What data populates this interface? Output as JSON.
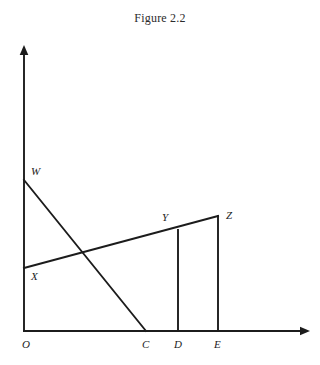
{
  "figure": {
    "caption": "Figure 2.2",
    "stroke_color": "#1c1c1c",
    "background_color": "#ffffff"
  },
  "axes": {
    "origin_label": "O",
    "origin": {
      "x": 24,
      "y": 331
    },
    "x_axis": {
      "from": {
        "x": 24,
        "y": 331
      },
      "to": {
        "x": 310,
        "y": 331
      },
      "arrow": true
    },
    "y_axis": {
      "from": {
        "x": 24,
        "y": 331
      },
      "to": {
        "x": 24,
        "y": 45
      },
      "arrow": true
    }
  },
  "points": [
    {
      "id": "W",
      "label": "W",
      "x": 24,
      "y": 180,
      "label_x": 31,
      "label_y": 166
    },
    {
      "id": "X",
      "label": "X",
      "x": 24,
      "y": 268,
      "label_x": 31,
      "label_y": 271
    },
    {
      "id": "Y",
      "label": "Y",
      "x": 178,
      "y": 230,
      "label_x": 162,
      "label_y": 212
    },
    {
      "id": "Z",
      "label": "Z",
      "x": 218,
      "y": 216,
      "label_x": 226,
      "label_y": 210
    },
    {
      "id": "C",
      "label": "C",
      "x": 146,
      "y": 331,
      "label_x": 142,
      "label_y": 339
    },
    {
      "id": "D",
      "label": "D",
      "x": 178,
      "y": 331,
      "label_x": 174,
      "label_y": 339
    },
    {
      "id": "E",
      "label": "E",
      "x": 218,
      "y": 331,
      "label_x": 214,
      "label_y": 339
    }
  ],
  "segments": [
    {
      "name": "line-w-to-c",
      "from": {
        "x": 24,
        "y": 180
      },
      "to": {
        "x": 146,
        "y": 331
      }
    },
    {
      "name": "line-x-to-z",
      "from": {
        "x": 24,
        "y": 268
      },
      "to": {
        "x": 218,
        "y": 216
      }
    },
    {
      "name": "vertical-y-to-d",
      "from": {
        "x": 178,
        "y": 230
      },
      "to": {
        "x": 178,
        "y": 331
      }
    },
    {
      "name": "vertical-z-to-e",
      "from": {
        "x": 218,
        "y": 216
      },
      "to": {
        "x": 218,
        "y": 331
      }
    }
  ],
  "chart_data": {
    "type": "line",
    "title": "Figure 2.2",
    "xlabel": "",
    "ylabel": "",
    "series": [
      {
        "name": "WC",
        "x": [
          24,
          146
        ],
        "y": [
          180,
          331
        ]
      },
      {
        "name": "XZ",
        "x": [
          24,
          218
        ],
        "y": [
          268,
          216
        ]
      },
      {
        "name": "YD",
        "x": [
          178,
          178
        ],
        "y": [
          230,
          331
        ]
      },
      {
        "name": "ZE",
        "x": [
          218,
          218
        ],
        "y": [
          216,
          331
        ]
      }
    ],
    "tick_labels_x": [
      "O",
      "C",
      "D",
      "E"
    ],
    "tick_labels_y": [
      "W",
      "X"
    ],
    "annotations": [
      "W",
      "X",
      "Y",
      "Z",
      "O",
      "C",
      "D",
      "E"
    ],
    "grid": false,
    "legend": "none"
  }
}
